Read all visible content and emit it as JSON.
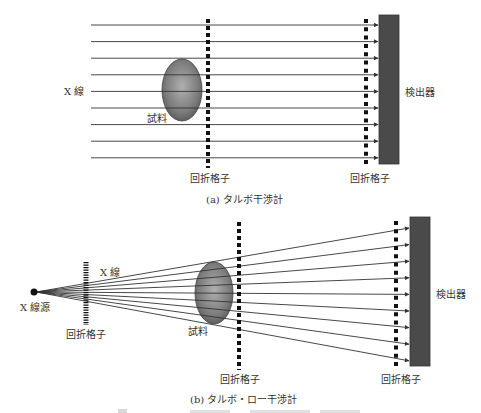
{
  "panel_a": {
    "caption": "(a) タルボ干渉計",
    "xray_label": "X 線",
    "sample_label": "試料",
    "grating1_label": "回折格子",
    "grating2_label": "回折格子",
    "detector_label": "検出器",
    "beam_count": 9
  },
  "panel_b": {
    "caption": "(b) タルボ・ロー干渉計",
    "source_label": "X 線源",
    "xray_label": "X 線",
    "sample_label": "試料",
    "source_grating_label": "回折格子",
    "grating1_label": "回折格子",
    "grating2_label": "回折格子",
    "detector_label": "検出器",
    "beam_count": 9
  },
  "colors": {
    "beam": "#333333",
    "grating": "#111111",
    "detector": "#4a4a4a",
    "sample_light": "#a8a8a8",
    "sample_dark": "#555555",
    "text": "#333333"
  }
}
